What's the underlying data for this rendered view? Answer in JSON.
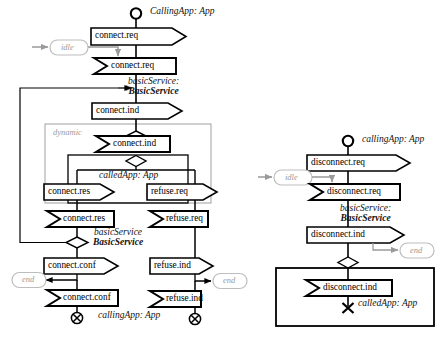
{
  "diagram": {
    "type": "uml-activity-sequence",
    "colors": {
      "stroke": "#000000",
      "gray_stroke": "#9a9a9a",
      "gray_text": "#9a9a9a",
      "fill": "#ffffff",
      "background": "#ffffff"
    }
  },
  "left_diagram": {
    "name": "connect-flow",
    "roles": {
      "calling_app_top": "CallingApp: App",
      "basic_service_upper_line1": "basicService:",
      "basic_service_upper_line2": "BasicService",
      "partition_dynamic": "dynamic",
      "called_app": "calledApp: App",
      "basic_service_lower_line1": "basicService",
      "basic_service_lower_line2": "BasicService",
      "calling_app_bottom": "callingApp: App"
    },
    "state_nodes": [
      {
        "name": "idle-state",
        "label": "idle"
      },
      {
        "name": "end-state-left",
        "label": "end"
      },
      {
        "name": "end-state-right",
        "label": "end"
      }
    ],
    "signals": [
      {
        "name": "send-connect-req",
        "label": "connect.req",
        "kind": "send"
      },
      {
        "name": "receive-connect-req",
        "label": "connect.req",
        "kind": "receive"
      },
      {
        "name": "send-connect-ind",
        "label": "connect.ind",
        "kind": "send"
      },
      {
        "name": "receive-connect-ind",
        "label": "connect.ind",
        "kind": "receive"
      },
      {
        "name": "send-connect-res",
        "label": "connect.res",
        "kind": "send"
      },
      {
        "name": "send-refuse-req",
        "label": "refuse.req",
        "kind": "send"
      },
      {
        "name": "receive-connect-res",
        "label": "connect.res",
        "kind": "receive"
      },
      {
        "name": "receive-refuse-req",
        "label": "refuse.req",
        "kind": "receive"
      },
      {
        "name": "send-connect-conf",
        "label": "connect.conf",
        "kind": "send"
      },
      {
        "name": "send-refuse-ind",
        "label": "refuse.ind",
        "kind": "send"
      },
      {
        "name": "receive-connect-conf",
        "label": "connect.conf",
        "kind": "receive"
      },
      {
        "name": "receive-refuse-ind",
        "label": "refuse.ind",
        "kind": "receive"
      }
    ],
    "terminators": [
      {
        "name": "flow-final-left",
        "symbol": "circled-x"
      },
      {
        "name": "flow-final-right",
        "symbol": "circled-x"
      }
    ],
    "initial_node": {
      "name": "initial-node-left",
      "symbol": "open-circle"
    }
  },
  "right_diagram": {
    "name": "disconnect-flow",
    "roles": {
      "calling_app": "callingApp: App",
      "basic_service_line1": "basicService:",
      "basic_service_line2": "BasicService",
      "called_app": "calledApp: App"
    },
    "state_nodes": [
      {
        "name": "idle-state",
        "label": "idle"
      },
      {
        "name": "end-state",
        "label": "end"
      }
    ],
    "signals": [
      {
        "name": "send-disconnect-req",
        "label": "disconnect.req",
        "kind": "send"
      },
      {
        "name": "receive-disconnect-req",
        "label": "disconnect.req",
        "kind": "receive"
      },
      {
        "name": "send-disconnect-ind",
        "label": "disconnect.ind",
        "kind": "send"
      },
      {
        "name": "receive-disconnect-ind",
        "label": "disconnect.ind",
        "kind": "receive"
      }
    ],
    "terminators": [
      {
        "name": "flow-final-x",
        "symbol": "x-mark"
      }
    ],
    "initial_node": {
      "name": "initial-node-right",
      "symbol": "open-circle"
    }
  }
}
